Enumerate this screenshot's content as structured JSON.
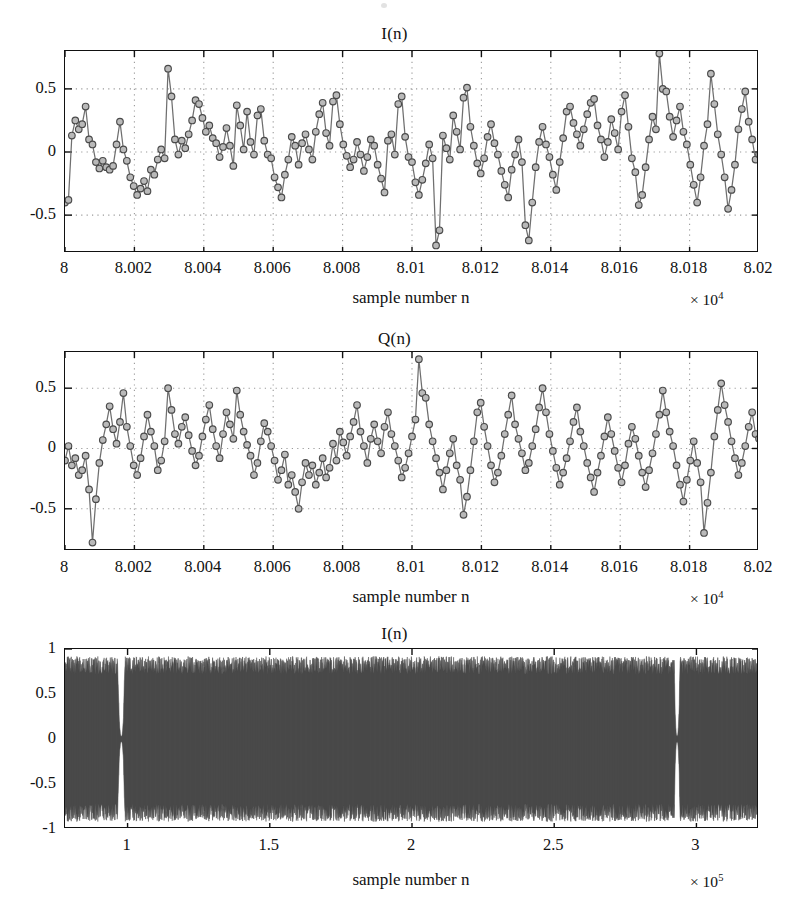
{
  "figure": {
    "background": "#ffffff",
    "axis_color": "#111111",
    "grid_color": "#9a9a9a",
    "line_color": "#6f6f6f",
    "marker_fill": "#b9b9b9",
    "marker_stroke": "#4a4a4a",
    "dense_trace_color": "#4a4a4a",
    "panel_count": 3
  },
  "chart_data": [
    {
      "type": "line",
      "panel_index": 0,
      "title": "I(n)",
      "xlabel": "sample number n",
      "ylabel": "",
      "x_exponent_label": "× 10",
      "x_exponent_power": "4",
      "xlim": [
        8.0,
        8.02
      ],
      "ylim": [
        -0.8,
        0.8
      ],
      "xticks": [
        8,
        8.002,
        8.004,
        8.006,
        8.008,
        8.01,
        8.012,
        8.014,
        8.016,
        8.018,
        8.02
      ],
      "xticklabels": [
        "8",
        "8.002",
        "8.004",
        "8.006",
        "8.008",
        "8.01",
        "8.012",
        "8.014",
        "8.016",
        "8.018",
        "8.02"
      ],
      "yticks": [
        0.5,
        0,
        -0.5
      ],
      "yticklabels": [
        "0.5",
        "0",
        "-0.5"
      ],
      "grid": true,
      "marker": "circle",
      "series_name": "I(n)",
      "x_step": 0.0001,
      "values": [
        -0.4,
        -0.38,
        0.13,
        0.25,
        0.18,
        0.22,
        0.36,
        0.1,
        0.06,
        -0.08,
        -0.13,
        -0.07,
        -0.12,
        -0.14,
        -0.11,
        0.06,
        0.24,
        0.02,
        -0.07,
        -0.2,
        -0.27,
        -0.34,
        -0.29,
        -0.23,
        -0.31,
        -0.14,
        -0.18,
        -0.06,
        0.02,
        -0.05,
        0.66,
        0.44,
        0.1,
        -0.02,
        0.09,
        0.03,
        0.14,
        0.25,
        0.41,
        0.38,
        0.27,
        0.16,
        0.21,
        0.11,
        0.07,
        -0.04,
        0.04,
        0.19,
        0.05,
        -0.11,
        0.37,
        0.21,
        0.02,
        0.32,
        0.08,
        -0.02,
        0.29,
        0.34,
        0.09,
        -0.02,
        -0.05,
        -0.2,
        -0.28,
        -0.36,
        -0.18,
        -0.06,
        0.12,
        0.05,
        -0.1,
        0.07,
        0.14,
        0.02,
        -0.06,
        0.16,
        0.3,
        0.39,
        0.15,
        0.05,
        0.4,
        0.45,
        0.22,
        0.06,
        -0.03,
        -0.12,
        -0.06,
        0.08,
        -0.02,
        -0.15,
        -0.04,
        0.1,
        0.05,
        -0.1,
        -0.21,
        -0.32,
        0.09,
        0.14,
        -0.02,
        0.38,
        0.44,
        0.12,
        -0.04,
        -0.08,
        -0.24,
        -0.34,
        -0.22,
        -0.09,
        0.06,
        -0.05,
        -0.74,
        -0.62,
        0.13,
        0.03,
        -0.06,
        0.29,
        0.16,
        0.02,
        0.43,
        0.51,
        0.2,
        0.05,
        -0.09,
        -0.17,
        -0.05,
        0.12,
        0.22,
        0.07,
        -0.02,
        -0.15,
        -0.26,
        -0.36,
        -0.14,
        -0.02,
        0.1,
        -0.08,
        -0.58,
        -0.7,
        -0.4,
        -0.12,
        0.08,
        0.2,
        0.06,
        -0.04,
        -0.18,
        -0.3,
        -0.08,
        0.11,
        0.32,
        0.36,
        0.23,
        0.14,
        0.05,
        0.18,
        0.3,
        0.39,
        0.42,
        0.21,
        0.1,
        -0.04,
        0.08,
        0.26,
        0.15,
        0.02,
        0.32,
        0.45,
        0.2,
        -0.05,
        -0.16,
        -0.42,
        -0.34,
        -0.12,
        0.1,
        0.28,
        0.18,
        0.78,
        0.5,
        0.48,
        0.28,
        0.12,
        0.25,
        0.36,
        0.16,
        0.06,
        -0.1,
        -0.26,
        -0.4,
        -0.2,
        0.05,
        0.22,
        0.62,
        0.38,
        0.14,
        -0.02,
        -0.2,
        -0.45,
        -0.3,
        -0.1,
        0.18,
        0.34,
        0.48,
        0.24,
        0.1,
        -0.06,
        -0.02
      ]
    },
    {
      "type": "line",
      "panel_index": 1,
      "title": "Q(n)",
      "xlabel": "sample number n",
      "ylabel": "",
      "x_exponent_label": "× 10",
      "x_exponent_power": "4",
      "xlim": [
        8.0,
        8.02
      ],
      "ylim": [
        -0.85,
        0.8
      ],
      "xticks": [
        8,
        8.002,
        8.004,
        8.006,
        8.008,
        8.01,
        8.012,
        8.014,
        8.016,
        8.018,
        8.02
      ],
      "xticklabels": [
        "8",
        "8.002",
        "8.004",
        "8.006",
        "8.008",
        "8.01",
        "8.012",
        "8.014",
        "8.016",
        "8.018",
        "8.02"
      ],
      "yticks": [
        0.5,
        0,
        -0.5
      ],
      "yticklabels": [
        "0.5",
        "0",
        "-0.5"
      ],
      "grid": true,
      "marker": "circle",
      "series_name": "Q(n)",
      "x_step": 0.0001,
      "values": [
        -0.1,
        0.02,
        -0.14,
        -0.08,
        -0.22,
        -0.18,
        -0.06,
        -0.34,
        -0.78,
        -0.42,
        -0.12,
        0.07,
        0.2,
        0.35,
        0.16,
        0.04,
        0.22,
        0.46,
        0.18,
        0.02,
        -0.14,
        -0.22,
        -0.08,
        0.1,
        0.28,
        0.14,
        0.02,
        -0.18,
        -0.1,
        0.06,
        0.5,
        0.32,
        0.12,
        0.04,
        0.18,
        0.26,
        0.11,
        -0.02,
        -0.14,
        -0.06,
        0.1,
        0.24,
        0.36,
        0.16,
        0.02,
        -0.08,
        0.12,
        0.3,
        0.2,
        0.08,
        0.48,
        0.28,
        0.14,
        0.03,
        -0.06,
        -0.22,
        -0.12,
        0.06,
        0.21,
        0.14,
        0.02,
        -0.1,
        -0.26,
        -0.18,
        -0.05,
        -0.3,
        -0.22,
        -0.36,
        -0.5,
        -0.28,
        -0.12,
        -0.22,
        -0.14,
        -0.3,
        -0.2,
        -0.08,
        -0.24,
        -0.16,
        0.04,
        -0.1,
        0.14,
        0.05,
        -0.06,
        0.1,
        0.22,
        0.36,
        0.14,
        0.02,
        -0.12,
        0.08,
        0.2,
        0.06,
        -0.04,
        0.18,
        0.3,
        0.12,
        0.02,
        -0.1,
        -0.24,
        -0.16,
        -0.04,
        0.1,
        0.24,
        0.74,
        0.46,
        0.42,
        0.2,
        0.06,
        -0.08,
        -0.2,
        -0.34,
        -0.18,
        -0.04,
        0.08,
        -0.14,
        -0.26,
        -0.55,
        -0.4,
        -0.18,
        0.06,
        0.3,
        0.38,
        0.18,
        0.02,
        -0.14,
        -0.28,
        -0.2,
        -0.06,
        0.12,
        0.28,
        0.44,
        0.2,
        0.08,
        -0.04,
        -0.18,
        -0.12,
        0.02,
        0.16,
        0.34,
        0.5,
        0.3,
        0.12,
        -0.02,
        -0.16,
        -0.3,
        -0.2,
        -0.08,
        0.06,
        0.22,
        0.34,
        0.14,
        0.02,
        -0.12,
        -0.24,
        -0.36,
        -0.2,
        -0.06,
        0.1,
        0.26,
        0.12,
        -0.02,
        -0.16,
        -0.28,
        -0.14,
        0.04,
        0.18,
        0.08,
        -0.06,
        -0.2,
        -0.32,
        -0.18,
        -0.04,
        0.12,
        0.28,
        0.48,
        0.3,
        0.14,
        0.02,
        -0.14,
        -0.3,
        -0.44,
        -0.26,
        -0.1,
        0.06,
        -0.12,
        -0.28,
        -0.7,
        -0.45,
        -0.2,
        0.1,
        0.32,
        0.54,
        0.36,
        0.22,
        0.06,
        -0.08,
        -0.22,
        -0.12,
        0.02,
        0.18,
        0.3,
        0.12,
        0.08
      ]
    },
    {
      "type": "line",
      "panel_index": 2,
      "title": "I(n)",
      "xlabel": "sample number n",
      "ylabel": "",
      "x_exponent_label": "× 10",
      "x_exponent_power": "5",
      "xlim": [
        0.78,
        3.22
      ],
      "ylim": [
        -1,
        1
      ],
      "xticks": [
        1,
        1.5,
        2,
        2.5,
        3
      ],
      "xticklabels": [
        "1",
        "1.5",
        "2",
        "2.5",
        "3"
      ],
      "yticks": [
        1,
        0.5,
        0,
        -0.5,
        -1
      ],
      "yticklabels": [
        "1",
        "0.5",
        "0",
        "-0.5",
        "-1"
      ],
      "grid": false,
      "marker": "none",
      "series_name": "I(n)",
      "description": "dense full-record waveform, envelope ~ ±0.9 with two narrow near-zero dropouts",
      "envelope": 0.9,
      "dropouts": [
        {
          "center": 0.978,
          "half_width": 0.012,
          "residual": 0.03
        },
        {
          "center": 2.932,
          "half_width": 0.01,
          "residual": 0.03
        }
      ]
    }
  ]
}
